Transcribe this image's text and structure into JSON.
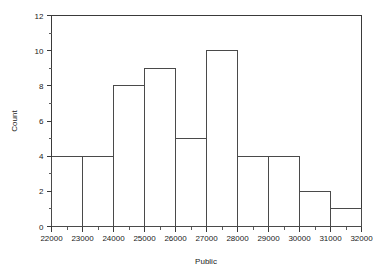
{
  "chart_data": {
    "type": "bar",
    "title": "",
    "subtitle": "",
    "xlabel": "Public",
    "ylabel": "Count",
    "xlim": [
      22000,
      32000
    ],
    "ylim": [
      0,
      12
    ],
    "grid": false,
    "legend": null,
    "bin_width": 1000,
    "x_major_step": 1000,
    "x_minor_step": 500,
    "y_major_step": 2,
    "y_minor_step": 1,
    "categories": [
      "22000-23000",
      "23000-24000",
      "24000-25000",
      "25000-26000",
      "26000-27000",
      "27000-28000",
      "28000-29000",
      "29000-30000",
      "30000-31000",
      "31000-32000"
    ],
    "bin_edges": [
      22000,
      23000,
      24000,
      25000,
      26000,
      27000,
      28000,
      29000,
      30000,
      31000,
      32000
    ],
    "values": [
      4,
      4,
      8,
      9,
      5,
      10,
      4,
      4,
      2,
      1
    ],
    "xticklabels": [
      "22000",
      "23000",
      "24000",
      "25000",
      "26000",
      "27000",
      "28000",
      "29000",
      "30000",
      "31000",
      "32000"
    ],
    "xtickvalues": [
      22000,
      23000,
      24000,
      25000,
      26000,
      27000,
      28000,
      29000,
      30000,
      31000,
      32000
    ],
    "yticklabels": [
      "0",
      "2",
      "4",
      "6",
      "8",
      "10",
      "12"
    ],
    "ytickvalues": [
      0,
      2,
      4,
      6,
      8,
      10,
      12
    ],
    "colors": {
      "bar_stroke": "#4a4a4a",
      "bar_fill": "none",
      "axis": "#3a3a3a",
      "text": "#1a1a1a",
      "background": "#ffffff"
    }
  }
}
